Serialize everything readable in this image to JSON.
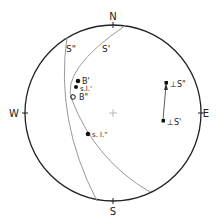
{
  "diagram": {
    "type": "stereonet",
    "directions": {
      "north": "N",
      "south": "S",
      "west": "W",
      "east": "E"
    },
    "great_circles": [
      {
        "label": "S\"",
        "color": "#999999"
      },
      {
        "label": "S'",
        "color": "#999999"
      }
    ],
    "points": [
      {
        "label": "B'",
        "marker": "filled-dot"
      },
      {
        "label": "s.l.'",
        "marker": "filled-dot"
      },
      {
        "label": "B\"",
        "marker": "open-circle"
      },
      {
        "label": "s. l.\"",
        "marker": "filled-dot"
      },
      {
        "label": "⊥S\"",
        "marker": "filled-square"
      },
      {
        "label": "⊥S'",
        "marker": "filled-square"
      }
    ],
    "colors": {
      "primitive": "#222222",
      "arc": "#999999",
      "marker": "#111111"
    }
  }
}
